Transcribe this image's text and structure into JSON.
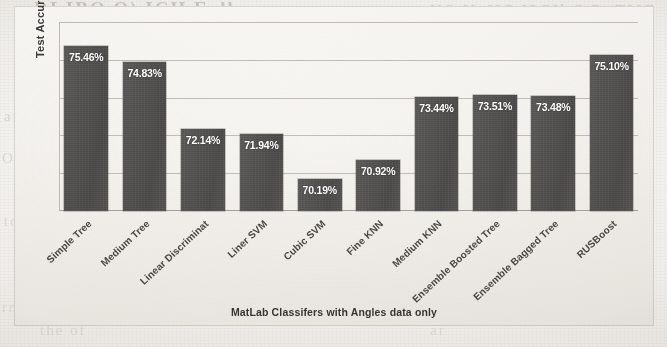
{
  "chart_data": {
    "type": "bar",
    "title": "",
    "xlabel": "MatLab Classifers with Angles data only",
    "ylabel": "Test Accuracy",
    "categories": [
      "Simple Tree",
      "Medium Tree",
      "Linear Discriminat",
      "Liner SVM",
      "Cubic SVM",
      "Fine KNN",
      "Medium KNN",
      "Ensemble Boosted Tree",
      "Ensemble Bagged Tree",
      "RUSBoost"
    ],
    "values": [
      75.46,
      74.83,
      72.14,
      71.94,
      70.19,
      70.92,
      73.44,
      73.51,
      73.48,
      75.1
    ],
    "data_labels": [
      "75.46%",
      "74.83%",
      "72.14%",
      "71.94%",
      "70.19%",
      "70.92%",
      "73.44%",
      "73.51%",
      "73.48%",
      "75.10%"
    ],
    "unit": "%",
    "ylim": [
      68.9,
      76.4
    ],
    "grid": true,
    "gridline_count": 5,
    "legend": null,
    "legend_position": "none",
    "bar_color": "#565453",
    "label_color": "#ffffff",
    "axis_text_color": "#4a4744",
    "plot_background": "#f6f4f1",
    "tick_label_rotation": -43
  },
  "page": {
    "background_color": "#f2f0ec",
    "scan_showthrough": [
      "DI IBO O) ICH Eoll",
      "UO  IL  IIG  I3GIl  C  B. TI0E",
      "and",
      "OI",
      "to",
      "rm",
      "no",
      "S",
      "e",
      "a",
      "the of",
      "ar",
      "eq"
    ]
  }
}
